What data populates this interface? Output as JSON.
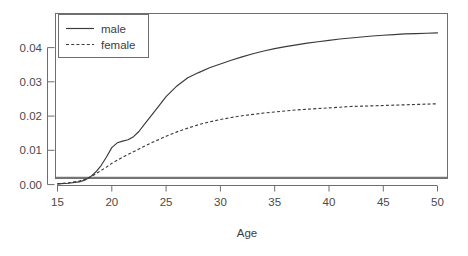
{
  "chart_data": {
    "type": "line",
    "title": "",
    "subtitle": "",
    "xlabel": "Age",
    "ylabel": "",
    "xlim": [
      14.0,
      51.0
    ],
    "ylim": [
      0.0,
      0.0465
    ],
    "grid": false,
    "legend_position": "top-left",
    "x_ticks": [
      15,
      20,
      25,
      30,
      35,
      40,
      45,
      50
    ],
    "x_tick_labels": [
      "15",
      "20",
      "25",
      "30",
      "35",
      "40",
      "45",
      "50"
    ],
    "y_ticks": [
      0.0,
      0.01,
      0.02,
      0.03,
      0.04
    ],
    "y_tick_labels": [
      "0.00",
      "0.01",
      "0.02",
      "0.03",
      "0.04"
    ],
    "x": [
      15,
      16,
      17,
      17.5,
      18,
      18.5,
      19,
      19.5,
      20,
      20.5,
      21,
      21.5,
      22,
      22.5,
      23,
      24,
      25,
      26,
      27,
      28,
      29,
      30,
      31,
      32,
      33,
      34,
      35,
      36,
      37,
      38,
      39,
      40,
      41,
      42,
      43,
      44,
      45,
      46,
      47,
      48,
      49,
      50
    ],
    "series": [
      {
        "name": "male",
        "style": "solid",
        "color": "#3a3a3a",
        "values": [
          0.0002,
          0.0004,
          0.0008,
          0.0013,
          0.0022,
          0.0036,
          0.0055,
          0.008,
          0.0108,
          0.0122,
          0.0127,
          0.0131,
          0.014,
          0.0155,
          0.0176,
          0.0216,
          0.0257,
          0.0288,
          0.0312,
          0.0327,
          0.0341,
          0.0352,
          0.0363,
          0.0373,
          0.0382,
          0.039,
          0.0397,
          0.0403,
          0.0408,
          0.0413,
          0.0417,
          0.0421,
          0.0425,
          0.0428,
          0.0431,
          0.0434,
          0.0436,
          0.0438,
          0.044,
          0.0441,
          0.0442,
          0.0443
        ]
      },
      {
        "name": "female",
        "style": "dashed",
        "color": "#3a3a3a",
        "values": [
          0.0002,
          0.0005,
          0.001,
          0.0015,
          0.0022,
          0.0031,
          0.0041,
          0.0051,
          0.0062,
          0.0071,
          0.008,
          0.0088,
          0.0096,
          0.0104,
          0.0112,
          0.0127,
          0.0141,
          0.0154,
          0.0165,
          0.0175,
          0.0183,
          0.019,
          0.0196,
          0.0201,
          0.0205,
          0.0209,
          0.0212,
          0.0215,
          0.0218,
          0.022,
          0.0222,
          0.0224,
          0.0226,
          0.0228,
          0.0229,
          0.023,
          0.0231,
          0.0232,
          0.0233,
          0.0234,
          0.0235,
          0.0236
        ]
      }
    ],
    "legend": [
      {
        "label": "male",
        "style": "solid"
      },
      {
        "label": "female",
        "style": "dashed"
      }
    ],
    "annotations": []
  }
}
